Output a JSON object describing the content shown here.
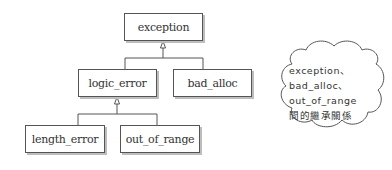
{
  "diagram": {
    "type": "class-hierarchy",
    "nodes": {
      "exception": "exception",
      "logic_error": "logic_error",
      "bad_alloc": "bad_alloc",
      "length_error": "length_error",
      "out_of_range": "out_of_range"
    },
    "edges": [
      {
        "from": "logic_error",
        "to": "exception",
        "kind": "inheritance"
      },
      {
        "from": "bad_alloc",
        "to": "exception",
        "kind": "inheritance"
      },
      {
        "from": "length_error",
        "to": "logic_error",
        "kind": "inheritance"
      },
      {
        "from": "out_of_range",
        "to": "logic_error",
        "kind": "inheritance"
      }
    ],
    "callout": {
      "lines": [
        "exception、",
        "bad_alloc、",
        "out_of_range",
        "間的繼承關係"
      ]
    },
    "colors": {
      "border": "#555555",
      "shadow": "#bdbdbd",
      "text": "#333333"
    }
  }
}
